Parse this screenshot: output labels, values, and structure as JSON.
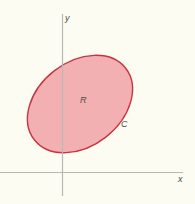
{
  "figure": {
    "axes": {
      "x_label": "x",
      "y_label": "y",
      "color": "#b9b9b4"
    },
    "region": {
      "label": "R",
      "fill_color": "#f2a7ac",
      "fill_opacity": 0.9
    },
    "curve": {
      "label": "C",
      "stroke_color": "#c8343f"
    },
    "background_color": "#fdfcf3"
  }
}
